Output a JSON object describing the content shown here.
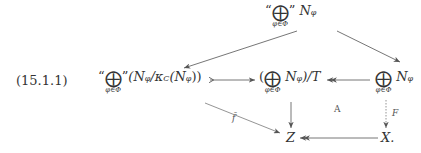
{
  "equation_label": "(15.1.1)",
  "nodes": {
    "top": {
      "quote_open": "“",
      "oplus": "⨁",
      "index": "φ∈Φ",
      "quote_close": "”",
      "term": "N",
      "sub": "φ"
    },
    "left": {
      "quote_open": "“",
      "oplus": "⨁",
      "index": "φ∈Φ",
      "quote_close": "”",
      "expr": "(N",
      "sub": "φ",
      "expr2": "/κ",
      "sub2": "C",
      "expr3": "(N",
      "sub3": "φ",
      "expr4": "))"
    },
    "middle": {
      "paren_open": "(",
      "oplus": "⨁",
      "index": "φ∈Φ",
      "term": "N",
      "sub": "φ",
      "rest": ")/T"
    },
    "right": {
      "oplus": "⨁",
      "index": "φ∈Φ",
      "term": "N",
      "sub": "φ"
    },
    "z": {
      "label": "Z"
    },
    "x": {
      "label": "X."
    }
  },
  "arrow_labels": {
    "f_bar": "f̄",
    "F": "F",
    "A": "A"
  },
  "arrows": [
    {
      "from": "top",
      "to": "left",
      "style": "solid"
    },
    {
      "from": "top",
      "to": "right",
      "style": "solid"
    },
    {
      "from": "left",
      "to": "middle",
      "style": "mono"
    },
    {
      "from": "right",
      "to": "middle",
      "style": "epi"
    },
    {
      "from": "middle",
      "to": "z",
      "style": "solid"
    },
    {
      "from": "left",
      "to": "z",
      "style": "solid",
      "label": "f̄"
    },
    {
      "from": "right",
      "to": "x",
      "style": "dotted",
      "label": "F"
    },
    {
      "from": "x",
      "to": "z",
      "style": "epi"
    }
  ]
}
